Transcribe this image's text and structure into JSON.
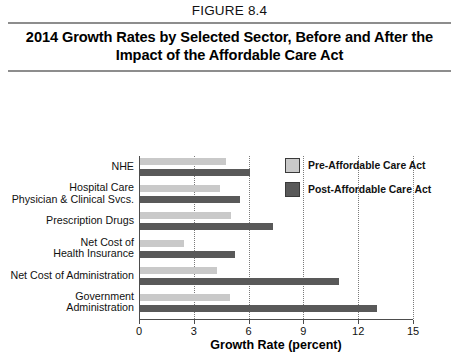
{
  "figure": {
    "label": "FIGURE 8.4",
    "title": "2014 Growth Rates by Selected Sector, Before and After the Impact of the Affordable Care Act"
  },
  "legend": {
    "position": "inside-top-right",
    "entries": [
      {
        "name": "Pre-Affordable Care Act",
        "color": "#c9c9c9",
        "swatch": "pre-aca-swatch"
      },
      {
        "name": "Post-Affordable Care Act",
        "color": "#595959",
        "swatch": "post-aca-swatch"
      }
    ]
  },
  "chart_data": {
    "type": "bar",
    "orientation": "horizontal",
    "title": "2014 Growth Rates by Selected Sector, Before and After the Impact of the Affordable Care Act",
    "xlabel": "Growth Rate (percent)",
    "ylabel": "",
    "xlim": [
      0,
      15
    ],
    "xticks": [
      0,
      3,
      6,
      9,
      12,
      15
    ],
    "xtick_labels": [
      "0",
      "3",
      "6",
      "9",
      "12",
      "15"
    ],
    "grid": "vertical-dotted",
    "categories": [
      "NHE",
      "Hospital Care\nPhysician & Clinical Svcs.",
      "Prescription Drugs",
      "Net Cost of\nHealth Insurance",
      "Net Cost of Administration",
      "Government\nAdministration"
    ],
    "series": [
      {
        "name": "Pre-Affordable Care Act",
        "color": "#c9c9c9",
        "values": [
          4.7,
          4.4,
          5.0,
          2.4,
          4.2,
          4.9
        ]
      },
      {
        "name": "Post-Affordable Care Act",
        "color": "#595959",
        "values": [
          6.0,
          5.5,
          7.3,
          5.2,
          10.9,
          13.0
        ]
      }
    ]
  }
}
